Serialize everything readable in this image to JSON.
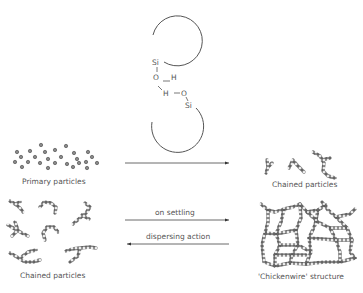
{
  "molecule": {
    "top_si": "Si",
    "o1": "O",
    "h1": "H",
    "h2": "H",
    "o2": "O",
    "bottom_si": "Si"
  },
  "labels": {
    "primary": "Primary particles",
    "chained_right": "Chained particles",
    "chained_left": "Chained particles",
    "chickenwire": "'Chickenwire' structure",
    "on_settling": "on settling",
    "dispersing": "dispersing action"
  },
  "colors": {
    "stroke": "#555555",
    "particle": "#777777",
    "text": "#555555"
  }
}
